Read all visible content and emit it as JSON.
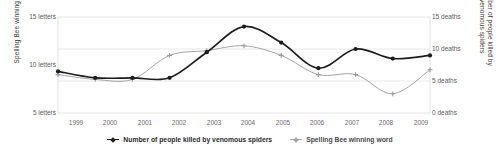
{
  "chart_data": {
    "type": "line",
    "title": "",
    "xlabel": "",
    "categories": [
      "1999",
      "2000",
      "2001",
      "2002",
      "2003",
      "2004",
      "2005",
      "2006",
      "2007",
      "2008",
      "2009"
    ],
    "x": [
      1999,
      2000,
      2001,
      2002,
      2003,
      2004,
      2005,
      2006,
      2007,
      2008,
      2009
    ],
    "grid": true,
    "legend_position": "bottom",
    "axes": {
      "left": {
        "label": "Spelling Bee winning word",
        "ticks": [
          {
            "value": 15,
            "text": "15 letters"
          },
          {
            "value": 10,
            "text": "10 letters"
          },
          {
            "value": 5,
            "text": "5 letters"
          }
        ],
        "ylim": [
          5,
          15
        ],
        "unit": "letters"
      },
      "right": {
        "label": "Number of people killed by venomous spiders",
        "ticks": [
          {
            "value": 15,
            "text": "15 deaths"
          },
          {
            "value": 10,
            "text": "10 deaths"
          },
          {
            "value": 5,
            "text": "5 deaths"
          },
          {
            "value": 0,
            "text": "0 deaths"
          }
        ],
        "ylim": [
          0,
          15
        ],
        "unit": "deaths"
      }
    },
    "series": [
      {
        "name": "Number of people killed by venomous spiders",
        "axis": "right",
        "color": "#1c1c1c",
        "marker": "diamond",
        "values": [
          6.5,
          5.5,
          5.5,
          5.5,
          9.5,
          13.5,
          11.0,
          7.0,
          10.0,
          8.5,
          9.0
        ]
      },
      {
        "name": "Spelling Bee winning word",
        "axis": "left",
        "color": "#9a9a9a",
        "marker": "plus",
        "values": [
          9.0,
          8.5,
          8.5,
          11.0,
          11.5,
          12.0,
          11.0,
          9.0,
          9.0,
          7.0,
          9.5
        ]
      }
    ]
  },
  "legend": {
    "items": [
      {
        "label": "Number of people killed by venomous spiders",
        "color": "#1c1c1c"
      },
      {
        "label": "Spelling Bee winning word",
        "color": "#9a9a9a"
      }
    ]
  }
}
